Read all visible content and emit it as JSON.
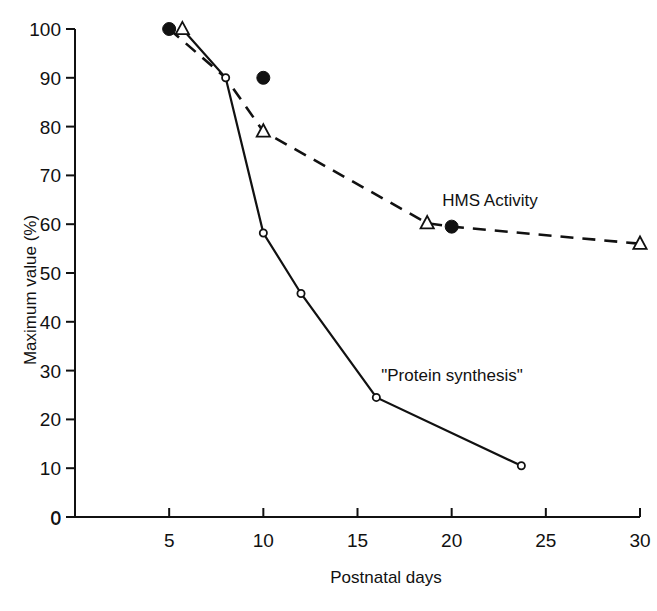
{
  "chart_data": {
    "type": "line",
    "title": "",
    "xlabel": "Postnatal days",
    "ylabel": "Maximum value (%)",
    "xlim": [
      0,
      30
    ],
    "ylim": [
      0,
      100
    ],
    "grid": false,
    "legend_position": "inline-annotations",
    "x_ticks": [
      0,
      5,
      10,
      15,
      20,
      25,
      30
    ],
    "x_tick_labels": [
      "0",
      "5",
      "10",
      "15",
      "20",
      "25",
      "30"
    ],
    "y_ticks": [
      0,
      10,
      20,
      30,
      40,
      50,
      60,
      70,
      80,
      90,
      100
    ],
    "y_tick_labels": [
      "0",
      "10",
      "20",
      "30",
      "40",
      "50",
      "60",
      "70",
      "80",
      "90",
      "100"
    ],
    "series": [
      {
        "name": "HMS Activity",
        "linestyle": "dashed",
        "annotation": "HMS Activity",
        "annotation_x": 24.1,
        "annotation_y": 68.5,
        "x": [
          5,
          8,
          10,
          18.7,
          20,
          30
        ],
        "y": [
          100,
          90,
          79,
          60.2,
          59.5,
          56
        ],
        "markers": [
          "filled-circle",
          "none",
          "open-triangle",
          "open-triangle",
          "filled-circle",
          "open-triangle"
        ]
      },
      {
        "name": "\"Protein synthesis\"",
        "linestyle": "solid",
        "annotation": "\"Protein synthesis\"",
        "annotation_x": 17.1,
        "annotation_y": 29.3,
        "x": [
          5.7,
          8,
          10,
          12,
          16,
          23.7
        ],
        "y": [
          100,
          90,
          58.2,
          45.8,
          24.5,
          10.5
        ],
        "markers": [
          "open-triangle",
          "open-circle",
          "open-circle",
          "open-circle",
          "open-circle",
          "open-circle"
        ]
      }
    ],
    "extra_markers": [
      {
        "name": "hms-point-day10-filled",
        "x": 10,
        "y": 90,
        "marker": "filled-circle"
      }
    ]
  },
  "axes": {
    "x_axis_label": "Postnatal days",
    "y_axis_label": "Maximum value (%)"
  },
  "annotations": {
    "hms": "HMS Activity",
    "protein": "\"Protein synthesis\""
  }
}
